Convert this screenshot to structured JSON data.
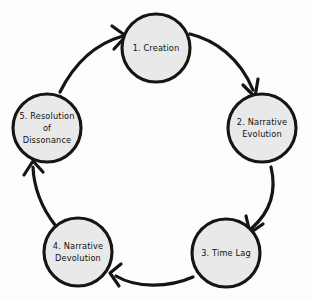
{
  "diagram": {
    "type": "cycle",
    "background_color": "#fdfdfd",
    "node_fill_color": "#e9e9e9",
    "node_stroke_color": "#151515",
    "arrow_color": "#151515",
    "direction": "clockwise",
    "nodes": [
      {
        "id": "creation",
        "order": "1",
        "label": "1. Creation",
        "lines": [
          "1. Creation"
        ],
        "cx": 156,
        "cy": 48,
        "r": 34
      },
      {
        "id": "narrative-evolution",
        "order": "2",
        "label": "2. Narrative Evolution",
        "lines": [
          "2. Narrative",
          "Evolution"
        ],
        "cx": 262,
        "cy": 128,
        "r": 34
      },
      {
        "id": "time-lag",
        "order": "3",
        "label": "3. Time Lag",
        "lines": [
          "3. Time Lag"
        ],
        "cx": 226,
        "cy": 253,
        "r": 34
      },
      {
        "id": "narrative-devolution",
        "order": "4",
        "label": "4. Narrative Devolution",
        "lines": [
          "4. Narrative",
          "Devolution"
        ],
        "cx": 78,
        "cy": 252,
        "r": 34
      },
      {
        "id": "resolution-of-dissonance",
        "order": "5",
        "label": "5. Resolution of Dissonance",
        "lines": [
          "5. Resolution",
          "of",
          "Dissonance"
        ],
        "cx": 47,
        "cy": 128,
        "r": 34
      }
    ],
    "edges": [
      {
        "id": "edge-1-2",
        "from": "creation",
        "to": "narrative-evolution"
      },
      {
        "id": "edge-2-3",
        "from": "narrative-evolution",
        "to": "time-lag"
      },
      {
        "id": "edge-3-4",
        "from": "time-lag",
        "to": "narrative-devolution"
      },
      {
        "id": "edge-4-5",
        "from": "narrative-devolution",
        "to": "resolution-of-dissonance"
      },
      {
        "id": "edge-5-1",
        "from": "resolution-of-dissonance",
        "to": "creation"
      }
    ]
  }
}
